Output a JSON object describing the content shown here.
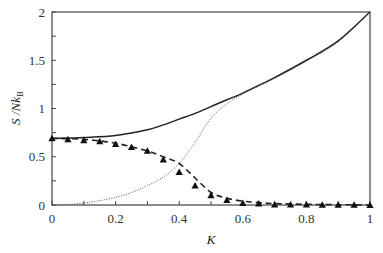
{
  "chart_data": {
    "type": "line",
    "title": "",
    "xlabel": "K",
    "ylabel": "S /Nk_B",
    "ylabel_parts": {
      "main": "S /Nk",
      "sub": "B"
    },
    "xlim": [
      0,
      1
    ],
    "ylim": [
      0,
      2
    ],
    "xticks": [
      0,
      0.2,
      0.4,
      0.6,
      0.8,
      1
    ],
    "xtick_labels": [
      "0",
      "0.2",
      "0.4",
      "0.6",
      "0.8",
      "1"
    ],
    "xminor_ticks": [
      0.1,
      0.3,
      0.5,
      0.7,
      0.9
    ],
    "yticks": [
      0,
      0.5,
      1,
      1.5,
      2
    ],
    "ytick_labels": [
      "0",
      "0.5",
      "1",
      "1.5",
      "2"
    ],
    "yminor_ticks": [
      0.25,
      0.75,
      1.25,
      1.75
    ],
    "grid": false,
    "legend": null,
    "series": [
      {
        "name": "total (solid)",
        "style": "solid",
        "color": "#222222",
        "x": [
          0,
          0.1,
          0.2,
          0.3,
          0.35,
          0.4,
          0.45,
          0.5,
          0.55,
          0.6,
          0.65,
          0.7,
          0.8,
          0.9,
          1.0
        ],
        "y": [
          0.69,
          0.7,
          0.72,
          0.78,
          0.83,
          0.89,
          0.95,
          1.02,
          1.09,
          1.16,
          1.24,
          1.32,
          1.5,
          1.7,
          2.0
        ]
      },
      {
        "name": "dotted",
        "style": "dotted",
        "color": "#555555",
        "x": [
          0,
          0.05,
          0.1,
          0.15,
          0.2,
          0.25,
          0.3,
          0.35,
          0.4,
          0.45,
          0.5,
          0.55,
          0.6,
          0.65,
          0.7,
          0.8,
          0.9,
          1.0
        ],
        "y": [
          0,
          0.005,
          0.02,
          0.045,
          0.08,
          0.13,
          0.2,
          0.29,
          0.43,
          0.65,
          0.9,
          1.05,
          1.15,
          1.23,
          1.31,
          1.49,
          1.69,
          2.0
        ]
      },
      {
        "name": "dashed",
        "style": "dashed",
        "color": "#222222",
        "x": [
          0,
          0.1,
          0.2,
          0.3,
          0.35,
          0.4,
          0.45,
          0.5,
          0.55,
          0.6,
          0.65,
          0.7,
          0.8,
          0.9,
          1.0
        ],
        "y": [
          0.69,
          0.68,
          0.64,
          0.56,
          0.5,
          0.43,
          0.28,
          0.13,
          0.07,
          0.04,
          0.025,
          0.015,
          0.007,
          0.003,
          0.0
        ]
      },
      {
        "name": "triangles",
        "style": "markers",
        "marker": "triangle",
        "color": "#111111",
        "x": [
          0,
          0.05,
          0.1,
          0.15,
          0.2,
          0.25,
          0.3,
          0.35,
          0.4,
          0.45,
          0.5,
          0.55,
          0.6,
          0.65,
          0.7,
          0.75,
          0.8,
          0.85,
          0.9,
          0.95,
          1.0
        ],
        "y": [
          0.69,
          0.68,
          0.67,
          0.66,
          0.63,
          0.6,
          0.56,
          0.47,
          0.34,
          0.2,
          0.1,
          0.05,
          0.02,
          0.015,
          0.005,
          0.005,
          0.003,
          0.002,
          0.001,
          0.001,
          0.0
        ]
      }
    ]
  },
  "plot_area": {
    "left": 52,
    "top": 12,
    "right": 370,
    "bottom": 205
  }
}
